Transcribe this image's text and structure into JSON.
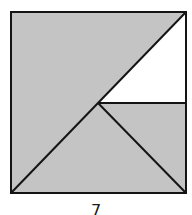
{
  "figure": {
    "caption": "7",
    "colors": {
      "shaded": "#c4c4c4",
      "unshaded": "#ffffff",
      "stroke": "#141414"
    },
    "square": {
      "x1": 11,
      "y1": 12,
      "x2": 186,
      "y2": 193
    },
    "center_point": {
      "x": 98,
      "y": 103
    },
    "regions": [
      {
        "name": "unshaded-triangle",
        "fill": "white",
        "points": [
          [
            98,
            103
          ],
          [
            186,
            12
          ],
          [
            186,
            103
          ]
        ]
      },
      {
        "name": "shaded-remainder",
        "fill": "gray"
      }
    ],
    "segments": [
      {
        "name": "diagonal",
        "from": [
          11,
          193
        ],
        "to": [
          186,
          12
        ]
      },
      {
        "name": "center-to-bottom-right",
        "from": [
          98,
          103
        ],
        "to": [
          186,
          193
        ]
      },
      {
        "name": "horizontal",
        "from": [
          98,
          103
        ],
        "to": [
          186,
          103
        ]
      }
    ]
  }
}
